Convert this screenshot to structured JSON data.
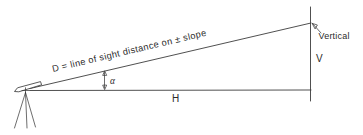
{
  "diagram": {
    "background_color": "#ffffff",
    "ink_color": "#3c3c3c",
    "labels": {
      "slope_distance": "D = line of sight distance on ± slope",
      "horizontal_distance": "H",
      "vertical_distance": "V",
      "vertical_reference": "Vertical",
      "angle": "α"
    },
    "icons": {
      "transit": "transit-instrument-icon",
      "tripod": "tripod-icon",
      "angle_arrow": "angle-arrow-icon",
      "vertical_pointer": "vertical-pointer-arrow-icon"
    },
    "geometry": {
      "instrument_station": [
        28,
        90
      ],
      "target_top": [
        310,
        23
      ],
      "target_bottom": [
        310,
        90
      ],
      "vertical_line_top": [
        310,
        8
      ],
      "vertical_line_bottom": [
        310,
        100
      ],
      "slope_angle_degrees": 13.5
    }
  }
}
